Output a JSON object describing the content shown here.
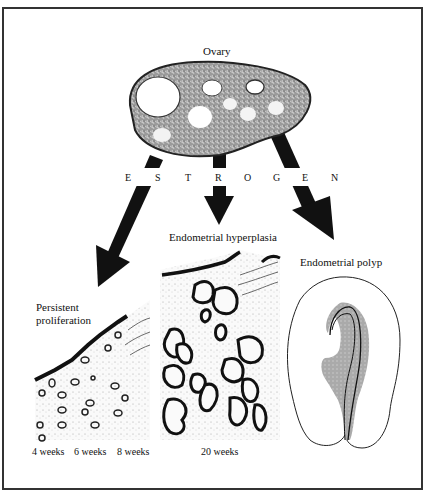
{
  "figure": {
    "ovary_label": "Ovary",
    "hormone_letters": [
      "E",
      "S",
      "T",
      "R",
      "O",
      "G",
      "E",
      "N"
    ],
    "outcomes": {
      "left": {
        "title_line1": "Persistent",
        "title_line2": "proliferation"
      },
      "middle": {
        "title": "Endometrial hyperplasia"
      },
      "right": {
        "title": "Endometrial polyp"
      }
    },
    "time_labels": {
      "w4": "4 weeks",
      "w6": "6 weeks",
      "w8": "8 weeks",
      "w20": "20 weeks"
    }
  },
  "colors": {
    "border": "#333333",
    "ink": "#111111",
    "ovary_fill": "#8a8a8a",
    "polyp_gray": "#9a9a9a"
  }
}
